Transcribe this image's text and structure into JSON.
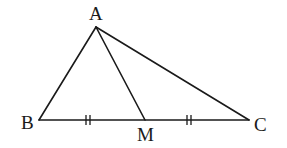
{
  "diagram": {
    "type": "triangle-with-median",
    "points": {
      "A": {
        "label": "A",
        "x": 96,
        "y": 27
      },
      "B": {
        "label": "B",
        "x": 39,
        "y": 120
      },
      "M": {
        "label": "M",
        "x": 145,
        "y": 120
      },
      "C": {
        "label": "C",
        "x": 249,
        "y": 120
      }
    },
    "segments": [
      "AB",
      "AC",
      "BC",
      "AM"
    ],
    "equal_marks": [
      {
        "segment": "BM",
        "marks": 2
      },
      {
        "segment": "MC",
        "marks": 2
      }
    ],
    "labels": {
      "A": "A",
      "B": "B",
      "M": "M",
      "C": "C"
    },
    "colors": {
      "stroke": "#1a1a1a",
      "background": "#ffffff"
    }
  }
}
